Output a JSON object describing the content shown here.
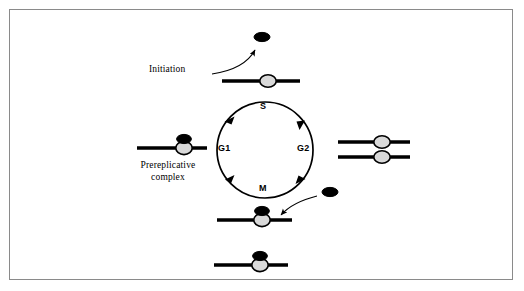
{
  "figure": {
    "border_color": "#8a8a8a",
    "background": "#ffffff"
  },
  "colors": {
    "stroke": "#000000",
    "dna_bar": "#000000",
    "origin_fill": "#d9d9d9",
    "licensing_factor_fill": "#000000",
    "frame": "#8a8a8a"
  },
  "labels": {
    "initiation": "Initiation",
    "prereplicative_line1": "Prereplicative",
    "prereplicative_line2": "complex"
  },
  "cycle": {
    "direction": "clockwise",
    "center_x": 265,
    "center_y": 150,
    "radius": 48,
    "phases": [
      {
        "id": "s",
        "label": "S",
        "position": "top"
      },
      {
        "id": "g1",
        "label": "G1",
        "position": "left"
      },
      {
        "id": "g2",
        "label": "G2",
        "position": "right"
      },
      {
        "id": "m",
        "label": "M",
        "position": "bottom"
      }
    ],
    "arrowheads": [
      {
        "id": "arrow-g1-to-s",
        "angle_deg": 215,
        "points": "clockwise"
      },
      {
        "id": "arrow-s-to-g2",
        "angle_deg": 325,
        "points": "clockwise"
      },
      {
        "id": "arrow-g2-to-m",
        "angle_deg": 35,
        "points": "clockwise"
      },
      {
        "id": "arrow-m-to-g1",
        "angle_deg": 145,
        "points": "clockwise"
      }
    ]
  },
  "elements": {
    "released_factor_top": {
      "cx": 262,
      "cy": 37,
      "rx": 8,
      "ry": 4.5,
      "fill": "#000000"
    },
    "released_factor_bottom": {
      "cx": 330,
      "cy": 192,
      "rx": 8,
      "ry": 4.5,
      "fill": "#000000"
    },
    "dna_initiation": {
      "x1": 222,
      "x2": 300,
      "y": 81,
      "origin_cx": 268,
      "has_factor": false
    },
    "dna_prereplicative": {
      "x1": 137,
      "x2": 207,
      "y": 148,
      "origin_cx": 184,
      "has_factor": true
    },
    "dna_replicated_upper": {
      "x1": 338,
      "x2": 410,
      "y": 142,
      "origin_cx": 382,
      "has_factor": false
    },
    "dna_replicated_lower": {
      "x1": 338,
      "x2": 410,
      "y": 155,
      "origin_cx": 382,
      "has_factor": false
    },
    "dna_post_mitosis": {
      "x1": 217,
      "x2": 292,
      "y": 220,
      "origin_cx": 262,
      "has_factor": true
    },
    "dna_g1_reset": {
      "x1": 214,
      "x2": 288,
      "y": 265,
      "origin_cx": 260,
      "has_factor": true
    }
  },
  "arrows": {
    "initiation_release": {
      "path": "M 213,74 C 233,70 250,62 256,49",
      "description": "curved arrow from DNA up to released licensing factor"
    },
    "licensing_load": {
      "path": "M 318,196 C 300,199 288,206 280,214",
      "description": "curved arrow from free licensing factor down-left onto DNA"
    }
  }
}
